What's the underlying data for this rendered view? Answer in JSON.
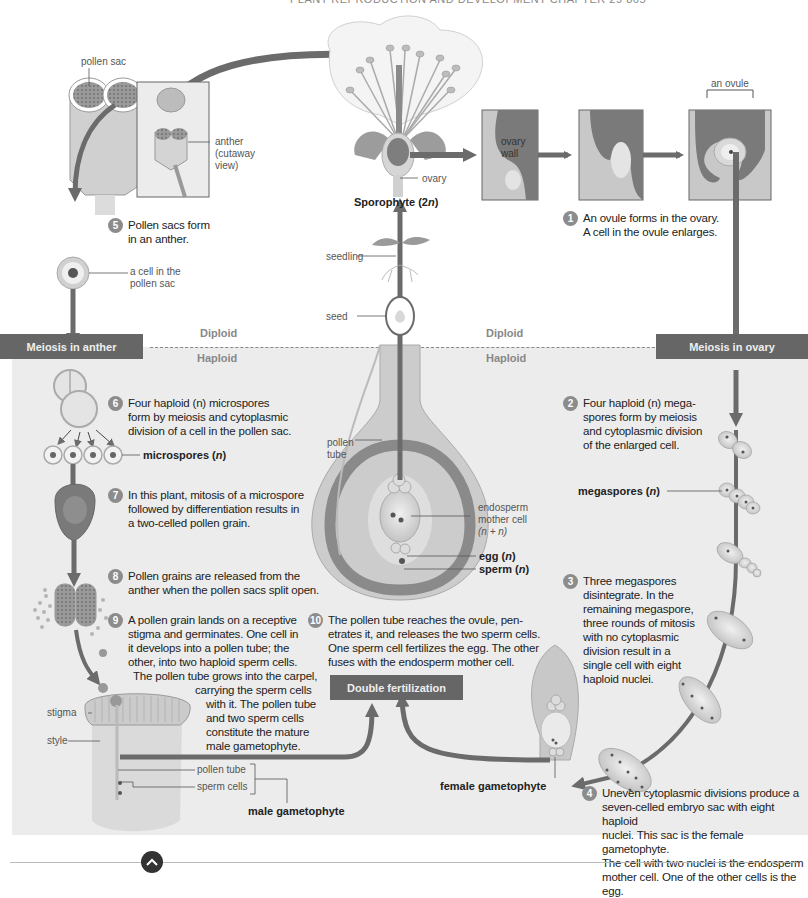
{
  "header": {
    "running_head": "PLANT REPRODUCTION AND DEVELOPMENT   CHAPTER 29   865"
  },
  "zones": {
    "diploid_left": "Diploid",
    "diploid_right": "Diploid",
    "haploid_left": "Haploid",
    "haploid_right": "Haploid"
  },
  "boxes": {
    "meiosis_anther": "Meiosis in anther",
    "meiosis_ovary": "Meiosis in ovary",
    "double_fertilization": "Double fertilization"
  },
  "labels": {
    "pollen_sac": "pollen sac",
    "anther_line1": "anther",
    "anther_line2": "(cutaway",
    "anther_line3": "view)",
    "ovary": "ovary",
    "sporophyte": "Sporophyte (2",
    "sporophyte_n": "n",
    "sporophyte_end": ")",
    "ovary_wall_1": "ovary",
    "ovary_wall_2": "wall",
    "an_ovule": "an ovule",
    "cell_in_pollen_sac_1": "a cell in the",
    "cell_in_pollen_sac_2": "pollen sac",
    "seedling": "seedling",
    "seed": "seed",
    "microspores": "microspores (",
    "microspores_n": "n",
    "microspores_end": ")",
    "megaspores": "megaspores (",
    "megaspores_n": "n",
    "megaspores_end": ")",
    "pollen_tube_center_1": "pollen",
    "pollen_tube_center_2": "tube",
    "endosperm_1": "endosperm",
    "endosperm_2": "mother cell",
    "endosperm_3": "(n + n)",
    "egg": "egg (",
    "egg_n": "n",
    "egg_end": ")",
    "sperm": "sperm (",
    "sperm_n": "n",
    "sperm_end": ")",
    "stigma": "stigma",
    "style": "style",
    "pollen_tube": "pollen tube",
    "sperm_cells": "sperm cells",
    "male_gametophyte": "male gametophyte",
    "female_gametophyte": "female gametophyte"
  },
  "steps": [
    {
      "num": "1",
      "text": "An ovule forms in the ovary. A cell in the ovule enlarges."
    },
    {
      "num": "2",
      "text": "Four haploid (n) mega-spores form by meiosis and cytoplasmic division of the enlarged cell."
    },
    {
      "num": "3",
      "text": "Three megaspores disintegrate. In the remaining megaspore, three rounds of mitosis with no cytoplasmic division result in a single cell with eight haploid nuclei."
    },
    {
      "num": "4",
      "text": "Uneven cytoplasmic divisions produce a seven-celled embryo sac with eight haploid nuclei. This sac is the female gametophyte. The cell with two nuclei is the endosperm mother cell. One of the other cells is the egg."
    },
    {
      "num": "5",
      "text": "Pollen sacs form in an anther."
    },
    {
      "num": "6",
      "text": "Four haploid (n) microspores form by meiosis and cytoplasmic division of a cell in the pollen sac."
    },
    {
      "num": "7",
      "text": "In this plant, mitosis of a microspore followed by differentiation results in a two-celled pollen grain."
    },
    {
      "num": "8",
      "text": "Pollen grains are released from the anther when the pollen sacs split open."
    },
    {
      "num": "9",
      "text": "A pollen grain lands on a receptive stigma and germinates. One cell in it develops into a pollen tube; the other, into two haploid sperm cells. The pollen tube grows into the carpel, carrying the sperm cells with it. The pollen tube and two sperm cells constitute the mature male gametophyte."
    },
    {
      "num": "10",
      "text": "The pollen tube reaches the ovule, pen-etrates it, and releases the two sperm cells. One sperm cell fertilizes the egg. The other fuses with the endosperm mother cell."
    }
  ],
  "step_lines": {
    "s1": [
      "An ovule forms in the ovary.",
      "A cell in the ovule enlarges."
    ],
    "s2": [
      "Four haploid (n) mega-",
      "spores form by meiosis",
      "and cytoplasmic division",
      "of the enlarged cell."
    ],
    "s3": [
      "Three megaspores",
      "disintegrate. In the",
      "remaining megaspore,",
      "three rounds of mitosis",
      "with no cytoplasmic",
      "division result in a",
      "single cell with eight",
      "haploid nuclei."
    ],
    "s4": [
      "Uneven cytoplasmic divisions produce a",
      "seven-celled embryo sac with eight haploid",
      "nuclei. This sac is the female gametophyte.",
      "The cell with two nuclei is the endosperm",
      "mother cell. One of the other cells is the egg."
    ],
    "s5": [
      "Pollen sacs form",
      "in an anther."
    ],
    "s6": [
      "Four haploid (n) microspores",
      "form by meiosis and cytoplasmic",
      "division of a cell in the pollen sac."
    ],
    "s7": [
      "In this plant, mitosis of a microspore",
      "followed by differentiation results in",
      "a two-celled pollen grain."
    ],
    "s8": [
      "Pollen grains are released from the",
      "anther when the pollen sacs split open."
    ],
    "s9a": [
      "A pollen grain lands on a receptive",
      "stigma and germinates. One cell in",
      "it develops into a pollen tube; the",
      "other, into two haploid sperm cells."
    ],
    "s9b": [
      "The pollen tube grows into the carpel,"
    ],
    "s9c": [
      "carrying the sperm cells"
    ],
    "s9d": [
      "with it. The pollen tube",
      "and two sperm cells",
      "constitute the mature",
      "male gametophyte."
    ],
    "s10": [
      "The pollen tube reaches the ovule, pen-",
      "etrates it, and releases the two sperm cells.",
      "One sperm cell fertilizes the egg. The other",
      "fuses with the endosperm mother cell."
    ]
  },
  "colors": {
    "arrow": "#6b6b6b",
    "box_bg": "#666666",
    "badge": "#8c8c8c",
    "haploid_bg": "#ececec",
    "tissue_dark": "#7a7a7a",
    "tissue_light": "#c8c8c8"
  },
  "nav": {
    "scroll_up_icon": "chevron-up-icon"
  }
}
